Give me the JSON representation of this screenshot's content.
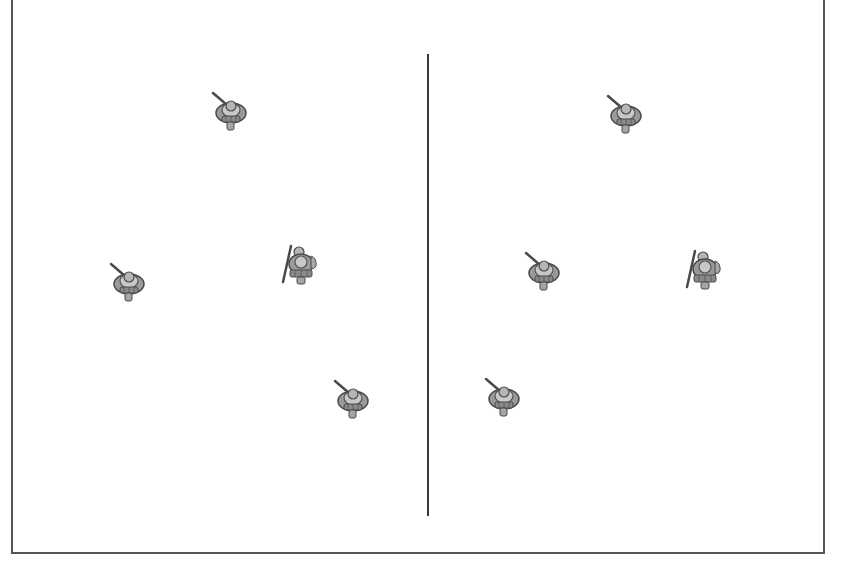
{
  "figure": {
    "colors": {
      "frame": "#555555",
      "divider": "#3a3a3a",
      "unit_dark": "#4a4a4a",
      "unit_mid": "#8a8a8a",
      "unit_light": "#c8c8c8"
    }
  },
  "panels": [
    {
      "name": "left-formation",
      "units": [
        {
          "id": "unit-1",
          "x": 230,
          "y": 112,
          "pose": "rifle"
        },
        {
          "id": "unit-2",
          "x": 128,
          "y": 283,
          "pose": "rifle"
        },
        {
          "id": "unit-3",
          "x": 300,
          "y": 265,
          "pose": "spear"
        },
        {
          "id": "unit-4",
          "x": 352,
          "y": 400,
          "pose": "rifle"
        }
      ]
    },
    {
      "name": "right-formation",
      "units": [
        {
          "id": "unit-5",
          "x": 625,
          "y": 115,
          "pose": "rifle"
        },
        {
          "id": "unit-6",
          "x": 543,
          "y": 272,
          "pose": "rifle"
        },
        {
          "id": "unit-7",
          "x": 704,
          "y": 270,
          "pose": "spear"
        },
        {
          "id": "unit-8",
          "x": 503,
          "y": 398,
          "pose": "rifle"
        }
      ]
    }
  ]
}
